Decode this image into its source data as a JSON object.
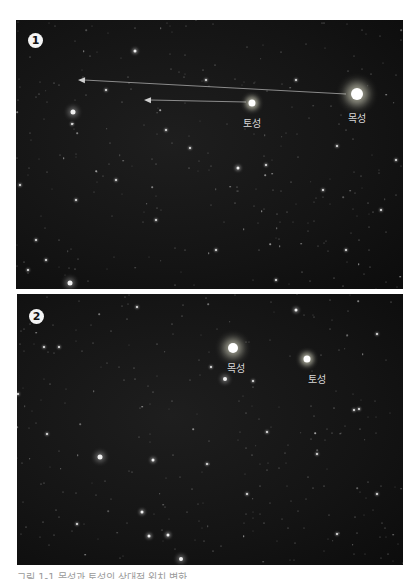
{
  "figure": {
    "panels": [
      {
        "id": "panel-1",
        "badge": "1",
        "planets": [
          {
            "name": "목성",
            "x": 341,
            "y": 74,
            "size": 12,
            "label_dx": 0,
            "label_dy": 16
          },
          {
            "name": "토성",
            "x": 236,
            "y": 83,
            "size": 7,
            "label_dx": 0,
            "label_dy": 12
          }
        ],
        "arrows": [
          {
            "from": [
              330,
              74
            ],
            "to": [
              62,
              60
            ]
          },
          {
            "from": [
              230,
              82
            ],
            "to": [
              128,
              80
            ]
          }
        ],
        "stars": [
          [
            57,
            92,
            5
          ],
          [
            119,
            31,
            3
          ],
          [
            222,
            148,
            3
          ],
          [
            54,
            263,
            5
          ],
          [
            4,
            165,
            2
          ],
          [
            307,
            170,
            2
          ],
          [
            174,
            128,
            2
          ],
          [
            250,
            145,
            2
          ],
          [
            321,
            126,
            2
          ],
          [
            56,
            104,
            2
          ],
          [
            30,
            240,
            2
          ],
          [
            20,
            220,
            2
          ],
          [
            140,
            200,
            2
          ],
          [
            280,
            60,
            2
          ],
          [
            190,
            60,
            2
          ],
          [
            365,
            190,
            2
          ],
          [
            100,
            160,
            2
          ],
          [
            60,
            180,
            2
          ],
          [
            330,
            230,
            2
          ],
          [
            200,
            230,
            2
          ],
          [
            380,
            140,
            2
          ],
          [
            150,
            110,
            2
          ],
          [
            260,
            260,
            2
          ],
          [
            90,
            70,
            2
          ],
          [
            12,
            250,
            2
          ]
        ]
      },
      {
        "id": "panel-2",
        "badge": "2",
        "planets": [
          {
            "name": "목성",
            "x": 216,
            "y": 54,
            "size": 10,
            "label_dx": 3,
            "label_dy": 12
          },
          {
            "name": "토성",
            "x": 290,
            "y": 65,
            "size": 7,
            "label_dx": 10,
            "label_dy": 12
          }
        ],
        "arrows": [],
        "stars": [
          [
            208,
            85,
            4
          ],
          [
            83,
            163,
            5
          ],
          [
            136,
            166,
            3
          ],
          [
            120,
            13,
            2
          ],
          [
            279,
            16,
            3
          ],
          [
            27,
            53,
            2
          ],
          [
            42,
            53,
            2
          ],
          [
            125,
            218,
            3
          ],
          [
            151,
            241,
            3
          ],
          [
            164,
            265,
            4
          ],
          [
            132,
            242,
            3
          ],
          [
            194,
            73,
            2
          ],
          [
            236,
            87,
            2
          ],
          [
            342,
            115,
            2
          ],
          [
            337,
            116,
            2
          ],
          [
            250,
            138,
            2
          ],
          [
            1,
            100,
            2
          ],
          [
            300,
            160,
            2
          ],
          [
            360,
            200,
            2
          ],
          [
            60,
            230,
            2
          ],
          [
            230,
            200,
            2
          ],
          [
            190,
            170,
            2
          ],
          [
            320,
            240,
            2
          ],
          [
            30,
            140,
            2
          ],
          [
            360,
            40,
            2
          ]
        ]
      }
    ],
    "caption": "그림 1-1 목성과 토성의 상대적 위치 변화"
  }
}
